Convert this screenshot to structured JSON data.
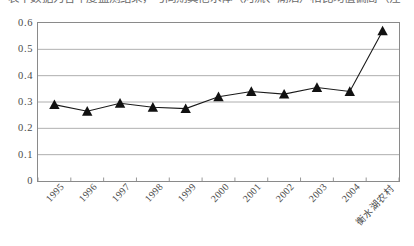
{
  "caption": {
    "text": "表中数据为各年度监测结果，与同期其他水体（河流、湖泊）相比均值偏高（注"
  },
  "chart_data": {
    "type": "line",
    "title": "",
    "xlabel": "",
    "ylabel": "",
    "ylim": [
      0,
      0.6
    ],
    "grid": true,
    "legend": "none",
    "marker": "triangle",
    "categories": [
      "1995",
      "1996",
      "1997",
      "1998",
      "1999",
      "2000",
      "2001",
      "2002",
      "2003",
      "2004",
      "衡水湖农村"
    ],
    "values": [
      0.29,
      0.265,
      0.295,
      0.28,
      0.275,
      0.32,
      0.34,
      0.33,
      0.355,
      0.34,
      0.57
    ],
    "ytick_labels": [
      "0",
      "0.1",
      "0.2",
      "0.3",
      "0.4",
      "0.5",
      "0.6"
    ],
    "ytick_values": [
      0,
      0.1,
      0.2,
      0.3,
      0.4,
      0.5,
      0.6
    ],
    "series": [
      {
        "name": "",
        "values": [
          0.29,
          0.265,
          0.295,
          0.28,
          0.275,
          0.32,
          0.34,
          0.33,
          0.355,
          0.34,
          0.57
        ]
      }
    ],
    "colors": {
      "line": "#1a1a1a",
      "marker": "#111111",
      "grid": "#9a9a9a",
      "axis": "#7d7d7d",
      "background": "#ffffff"
    }
  }
}
